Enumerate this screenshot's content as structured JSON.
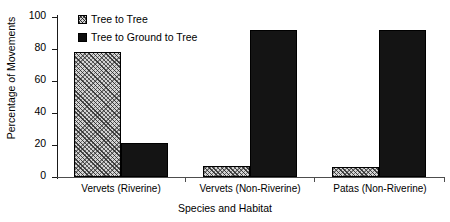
{
  "chart_data": {
    "type": "bar",
    "title": "",
    "xlabel": "Species and Habitat",
    "ylabel": "Percentage of Movements",
    "ylim": [
      0,
      100
    ],
    "yticks": [
      "0",
      "20",
      "40",
      "60",
      "80",
      "100"
    ],
    "grid": false,
    "legend_position": "upper-center-inside",
    "categories": [
      "Vervets (Riverine)",
      "Vervets (Non-Riverine)",
      "Patas (Non-Riverine)"
    ],
    "series": [
      {
        "name": "Tree to Tree",
        "swatch": "hatched-square-icon",
        "fill": "#d4d4d4",
        "values": [
          78,
          7,
          6
        ]
      },
      {
        "name": "Tree to Ground to Tree",
        "swatch": "filled-square-icon",
        "fill": "#141414",
        "values": [
          21,
          92,
          92
        ]
      }
    ]
  },
  "legend": {
    "items": [
      {
        "label": "Tree to Tree"
      },
      {
        "label": "Tree to Ground to Tree"
      }
    ]
  }
}
